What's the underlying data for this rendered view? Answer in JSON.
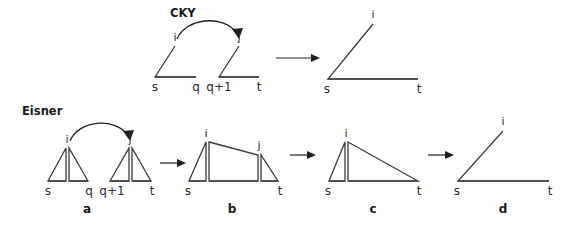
{
  "figure": {
    "title_cky": "CKY",
    "title_eisner": "Eisner",
    "labels": {
      "i": "i",
      "j": "j",
      "s": "s",
      "t": "t",
      "q": "q",
      "q_plus_1": "q+1"
    },
    "panels": {
      "a": "a",
      "b": "b",
      "c": "c",
      "d": "d"
    },
    "colors": {
      "shape_stroke": "#3a3a3a",
      "baseline_stroke": "#4a4a4a",
      "arrow_stroke": "#1f1f1f",
      "text": "#2b2b2b",
      "bold_text": "#1a1a1a",
      "background": "#ffffff"
    },
    "cky_row": {
      "name": "CKY",
      "items": [
        {
          "kind": "triangle",
          "apex_label": "i",
          "left_label": "s",
          "right_label": "q"
        },
        {
          "kind": "triangle",
          "apex_label": "j",
          "left_label": "q+1",
          "right_label": "t"
        },
        {
          "kind": "arrow",
          "label": ""
        },
        {
          "kind": "triangle",
          "apex_label": "i",
          "left_label": "s",
          "right_label": "t"
        }
      ],
      "dependency_arc": {
        "from": "i",
        "to": "j"
      }
    },
    "eisner_row": {
      "name": "Eisner",
      "items": [
        {
          "kind": "double-triangle-pair",
          "panel": "a",
          "apex_labels": [
            "i",
            "j"
          ],
          "span_labels": [
            "s",
            "q",
            "q+1",
            "t"
          ]
        },
        {
          "kind": "arrow",
          "label": ""
        },
        {
          "kind": "triangle-trapezoid-triangle",
          "panel": "b",
          "apex_labels": [
            "i",
            "j"
          ],
          "span_labels": [
            "s",
            "t"
          ]
        },
        {
          "kind": "arrow",
          "label": ""
        },
        {
          "kind": "triangle-bigtriangle",
          "panel": "c",
          "apex_labels": [
            "i"
          ],
          "span_labels": [
            "s",
            "t"
          ]
        },
        {
          "kind": "arrow",
          "label": ""
        },
        {
          "kind": "triangle",
          "panel": "d",
          "apex_labels": [
            "i"
          ],
          "span_labels": [
            "s",
            "t"
          ]
        }
      ],
      "dependency_arc": {
        "from": "i",
        "to": "j"
      }
    }
  }
}
